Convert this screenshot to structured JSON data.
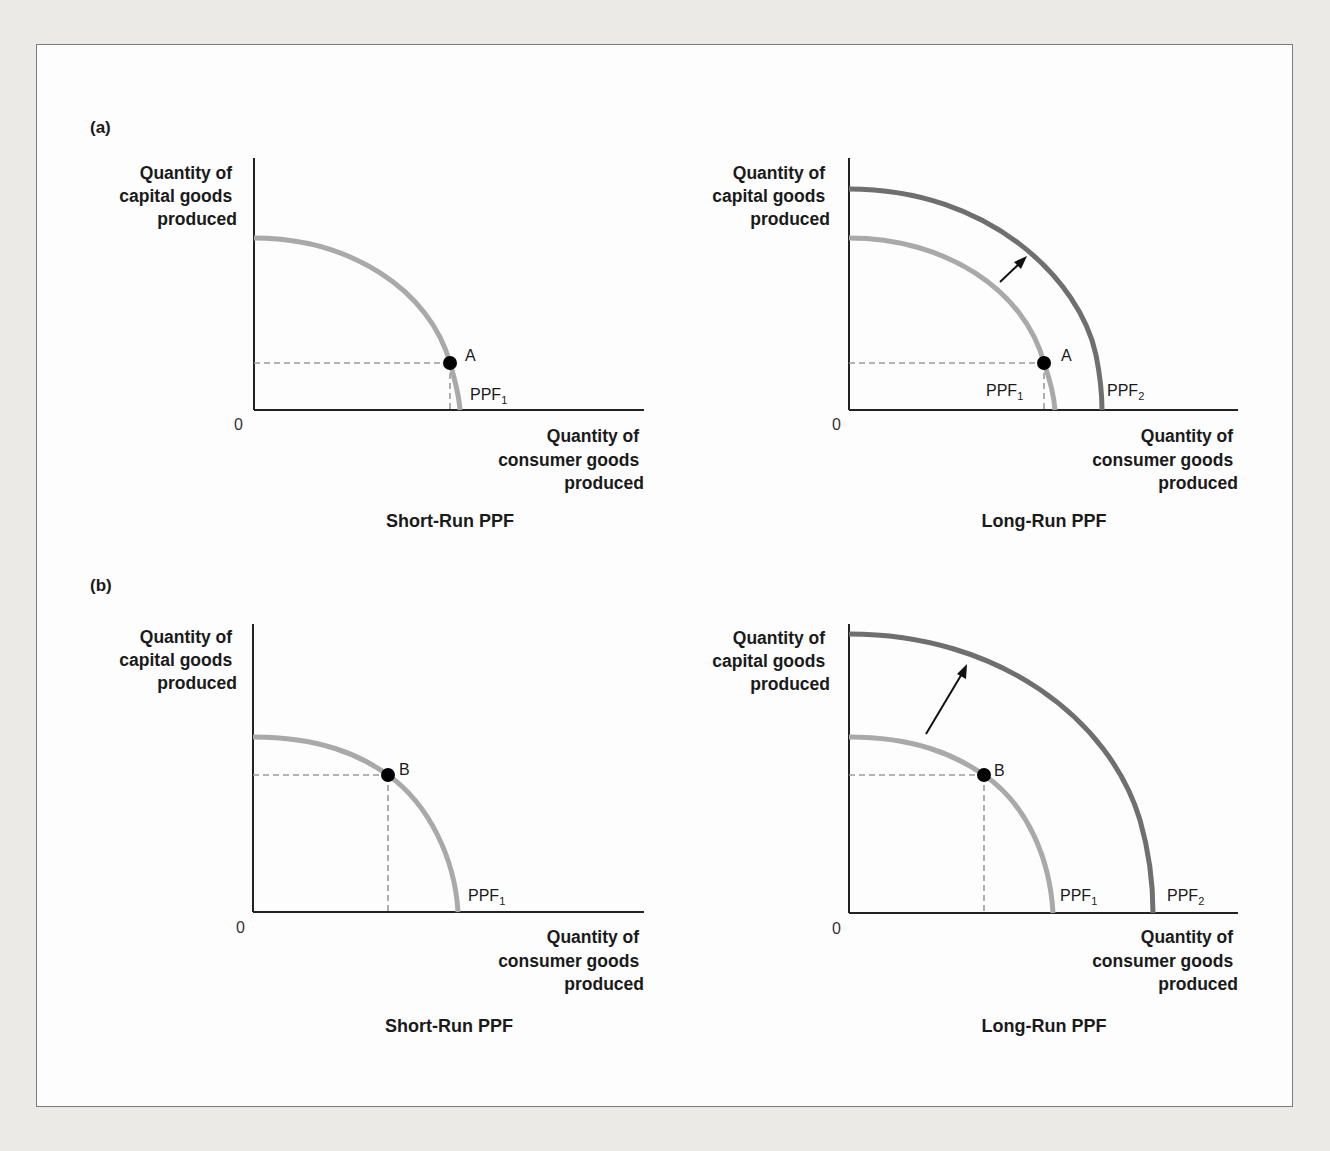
{
  "panels": [
    {
      "label": "(a)",
      "charts": [
        {
          "title": "Short-Run PPF",
          "y_axis": [
            "Quantity of",
            "capital goods",
            "produced"
          ],
          "x_axis": [
            "Quantity of",
            "consumer goods",
            "produced"
          ],
          "origin": "0",
          "curves": [
            {
              "name": "PPF",
              "sub": "1"
            }
          ],
          "point": "A"
        },
        {
          "title": "Long-Run PPF",
          "y_axis": [
            "Quantity of",
            "capital goods",
            "produced"
          ],
          "x_axis": [
            "Quantity of",
            "consumer goods",
            "produced"
          ],
          "origin": "0",
          "curves": [
            {
              "name": "PPF",
              "sub": "1"
            },
            {
              "name": "PPF",
              "sub": "2"
            }
          ],
          "point": "A"
        }
      ]
    },
    {
      "label": "(b)",
      "charts": [
        {
          "title": "Short-Run PPF",
          "y_axis": [
            "Quantity of",
            "capital goods",
            "produced"
          ],
          "x_axis": [
            "Quantity of",
            "consumer goods",
            "produced"
          ],
          "origin": "0",
          "curves": [
            {
              "name": "PPF",
              "sub": "1"
            }
          ],
          "point": "B"
        },
        {
          "title": "Long-Run PPF",
          "y_axis": [
            "Quantity of",
            "capital goods",
            "produced"
          ],
          "x_axis": [
            "Quantity of",
            "consumer goods",
            "produced"
          ],
          "origin": "0",
          "curves": [
            {
              "name": "PPF",
              "sub": "1"
            },
            {
              "name": "PPF",
              "sub": "2"
            }
          ],
          "point": "B"
        }
      ]
    }
  ],
  "colors": {
    "ppf1": "#a9a9a9",
    "ppf2": "#6f6f6f",
    "axis": "#222222",
    "point": "#000000"
  }
}
